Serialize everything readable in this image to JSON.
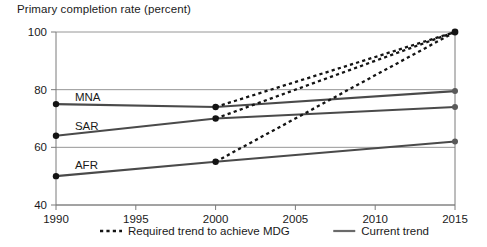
{
  "chart_data": {
    "type": "line",
    "title": "Primary completion rate (percent)",
    "xlabel": "",
    "ylabel": "",
    "xlim": [
      1990,
      2015
    ],
    "ylim": [
      40,
      100
    ],
    "xticks": [
      1990,
      1995,
      2000,
      2005,
      2010,
      2015
    ],
    "yticks": [
      40,
      60,
      80,
      100
    ],
    "grid": true,
    "legend_position": "bottom",
    "legend": [
      {
        "label": "Required trend to achieve MDG",
        "style": "dashed"
      },
      {
        "label": "Current trend",
        "style": "solid"
      }
    ],
    "series": [
      {
        "name": "MNA",
        "style": "solid",
        "label": "MNA",
        "x": [
          1990,
          2000,
          2015
        ],
        "values": [
          75,
          74,
          79.5
        ]
      },
      {
        "name": "SAR",
        "style": "solid",
        "label": "SAR",
        "x": [
          1990,
          2000,
          2015
        ],
        "values": [
          64,
          70,
          74
        ]
      },
      {
        "name": "AFR",
        "style": "solid",
        "label": "AFR",
        "x": [
          1990,
          2000,
          2015
        ],
        "values": [
          50,
          55,
          62
        ]
      },
      {
        "name": "MNA required",
        "style": "dashed",
        "label": "",
        "x": [
          2000,
          2015
        ],
        "values": [
          74,
          100
        ]
      },
      {
        "name": "SAR required",
        "style": "dashed",
        "label": "",
        "x": [
          2000,
          2015
        ],
        "values": [
          70,
          100
        ]
      },
      {
        "name": "AFR required",
        "style": "dashed",
        "label": "",
        "x": [
          2000,
          2015
        ],
        "values": [
          55,
          100
        ]
      }
    ],
    "annotations": [
      {
        "text": "MNA",
        "x": 1991,
        "y": 77.5
      },
      {
        "text": "SAR",
        "x": 1991,
        "y": 67.5
      },
      {
        "text": "AFR",
        "x": 1991,
        "y": 54
      }
    ]
  }
}
